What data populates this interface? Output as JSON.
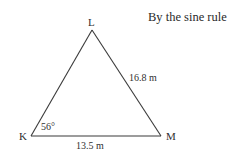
{
  "heading": "By the sine rule",
  "triangle": {
    "vertices": {
      "L": {
        "label": "L",
        "x": 92,
        "y": 30
      },
      "K": {
        "label": "K",
        "x": 31,
        "y": 136
      },
      "M": {
        "label": "M",
        "x": 161,
        "y": 136
      }
    },
    "sides": {
      "LM": {
        "label": "16.8 m"
      },
      "KM": {
        "label": "13.5 m"
      }
    },
    "angles": {
      "K": {
        "label": "56°"
      }
    },
    "stroke_color": "#3a3a3a"
  }
}
